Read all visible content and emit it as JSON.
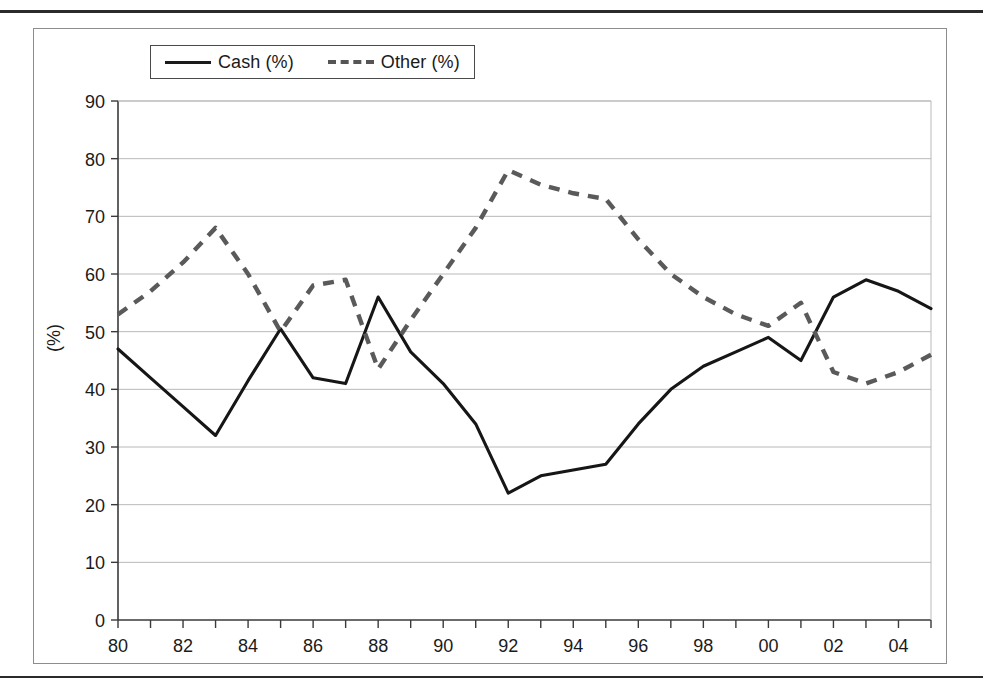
{
  "figure": {
    "frame_label": "chart-figure-frame",
    "y_axis_title": "(%)"
  },
  "legend": {
    "position": "top-left-inside",
    "items": [
      {
        "label": "Cash (%)",
        "style": "solid",
        "color": "#161616"
      },
      {
        "label": "Other (%)",
        "style": "dashed",
        "color": "#5a5a5a"
      }
    ]
  },
  "chart_data": {
    "type": "line",
    "title": "",
    "xlabel": "",
    "ylabel": "(%)",
    "ylim": [
      0,
      90
    ],
    "ytick_step": 10,
    "yticks": [
      "0",
      "10",
      "20",
      "30",
      "40",
      "50",
      "60",
      "70",
      "80",
      "90"
    ],
    "grid": true,
    "legend_position": "top-left",
    "x": [
      "80",
      "81",
      "82",
      "83",
      "84",
      "85",
      "86",
      "87",
      "88",
      "89",
      "90",
      "91",
      "92",
      "93",
      "94",
      "95",
      "96",
      "97",
      "98",
      "99",
      "00",
      "01",
      "02",
      "03",
      "04",
      "05"
    ],
    "xtick_labels": [
      "80",
      "",
      "82",
      "",
      "84",
      "",
      "86",
      "",
      "88",
      "",
      "90",
      "",
      "92",
      "",
      "94",
      "",
      "96",
      "",
      "98",
      "",
      "00",
      "",
      "02",
      "",
      "04",
      ""
    ],
    "series": [
      {
        "name": "Cash (%)",
        "style": "solid",
        "color": "#161616",
        "values": [
          47,
          42,
          37,
          32,
          41.5,
          50.5,
          42,
          41,
          56,
          46.5,
          41,
          34,
          22,
          25,
          26,
          27,
          34,
          40,
          44,
          46.5,
          49,
          45,
          56,
          59,
          57,
          54
        ]
      },
      {
        "name": "Other (%)",
        "style": "dashed",
        "color": "#5a5a5a",
        "values": [
          53,
          57,
          62,
          68,
          60,
          50,
          58,
          59,
          43.5,
          52,
          60,
          68,
          78,
          75.5,
          74,
          73,
          66,
          60,
          56,
          53,
          51,
          55,
          43,
          41,
          43,
          46
        ]
      }
    ]
  }
}
